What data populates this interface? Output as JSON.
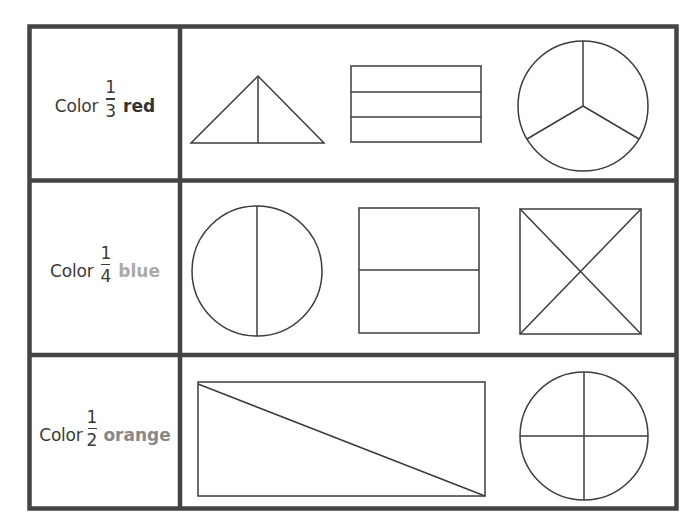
{
  "worksheet": {
    "rows": [
      {
        "instruction": "Color",
        "fraction": {
          "numerator": "1",
          "denominator": "3"
        },
        "color_word": "red",
        "color_word_tone": "#333333",
        "shapes": [
          "triangle-split-in-2",
          "rectangle-split-in-3",
          "circle-split-in-3"
        ]
      },
      {
        "instruction": "Color",
        "fraction": {
          "numerator": "1",
          "denominator": "4"
        },
        "color_word": "blue",
        "color_word_tone": "#aaaaaa",
        "shapes": [
          "circle-split-in-2",
          "square-split-in-2",
          "square-split-in-4-diagonal"
        ]
      },
      {
        "instruction": "Color",
        "fraction": {
          "numerator": "1",
          "denominator": "2"
        },
        "color_word": "orange",
        "color_word_tone": "#888888",
        "shapes": [
          "rectangle-split-diagonal-in-2",
          "circle-split-in-4"
        ]
      }
    ],
    "colors": {
      "border": "#444444",
      "shape_stroke": "#3c3c3c",
      "background": "#ffffff"
    }
  }
}
